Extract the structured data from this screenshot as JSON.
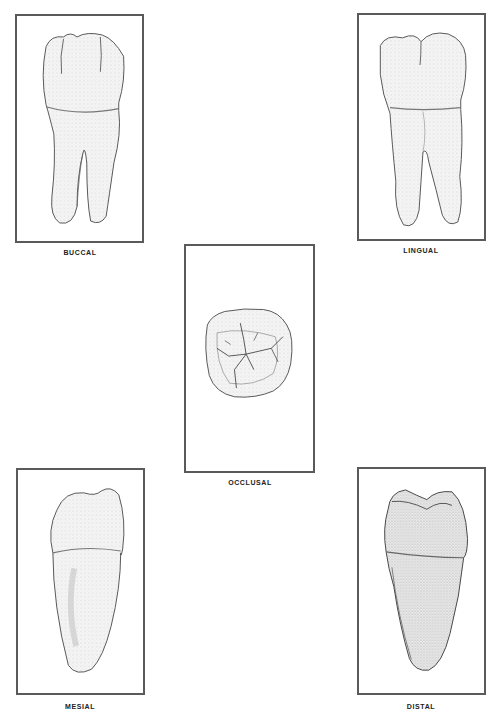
{
  "figure": {
    "views": [
      {
        "id": "buccal",
        "label": "BUCCAL"
      },
      {
        "id": "lingual",
        "label": "LINGUAL"
      },
      {
        "id": "occlusal",
        "label": "OCCLUSAL"
      },
      {
        "id": "mesial",
        "label": "MESIAL"
      },
      {
        "id": "distal",
        "label": "DISTAL"
      }
    ]
  },
  "colors": {
    "frame": "#5a5a5a",
    "tooth_fill": "#f4f4f4",
    "tooth_outline": "#555555",
    "shade": "#cfcfcf",
    "label": "#222222"
  }
}
